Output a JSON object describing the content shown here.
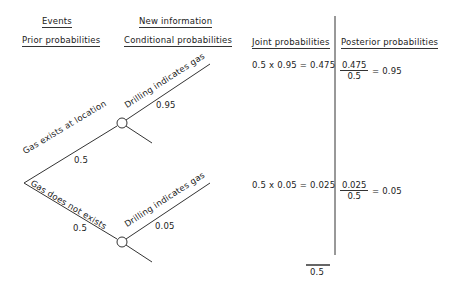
{
  "headers": {
    "events": "Events",
    "prior": "Prior probabilities",
    "new_info": "New information",
    "conditional": "Conditional probabilities",
    "joint": "Joint probabilities",
    "posterior": "Posterior probabilities"
  },
  "tree": {
    "branch_gas": {
      "label": "Gas exists at location",
      "prob": "0.5"
    },
    "branch_nogas": {
      "label": "Gas does not exists",
      "prob": "0.5"
    },
    "upper_indicator": {
      "label": "Drilling indicates gas",
      "prob": "0.95"
    },
    "lower_indicator": {
      "label": "Drilling indicates gas",
      "prob": "0.05"
    }
  },
  "joint": {
    "row1": "0.5 x 0.95 = 0.475",
    "row2": "0.5 x 0.05 = 0.025",
    "total": "0.5"
  },
  "posterior": {
    "row1": {
      "num": "0.475",
      "den": "0.5",
      "result": "= 0.95"
    },
    "row2": {
      "num": "0.025",
      "den": "0.5",
      "result": "= 0.05"
    }
  }
}
